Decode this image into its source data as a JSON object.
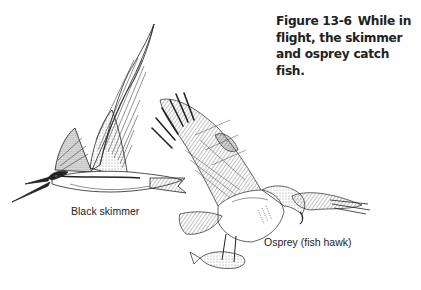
{
  "figure": {
    "number": "Figure 13-6",
    "caption_lines": [
      "While in",
      "flight, the skimmer",
      "and osprey catch fish."
    ]
  },
  "illustrations": [
    {
      "name": "black-skimmer",
      "label": "Black skimmer"
    },
    {
      "name": "osprey",
      "label": "Osprey (fish hawk)"
    }
  ],
  "colors": {
    "ink": "#222222",
    "background": "#ffffff"
  }
}
